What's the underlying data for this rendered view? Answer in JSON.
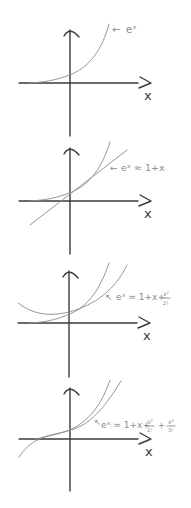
{
  "diagram": {
    "colors": {
      "axes": "#3a3a3a",
      "curves": "#8a8a8a",
      "background": "#ffffff"
    },
    "panels": [
      {
        "label_arrow": "←",
        "label": "eˣ",
        "axis_label": "x",
        "approximation": "none"
      },
      {
        "label_arrow": "←",
        "label": "eˣ ≈ 1+x",
        "axis_label": "x",
        "approximation": "1+x"
      },
      {
        "label_arrow": "↖",
        "label": "eˣ ≈ 1+x+",
        "frac_num": "x²",
        "frac_den": "2!",
        "axis_label": "x",
        "approximation": "1+x+x^2/2!"
      },
      {
        "label_arrow": "↖",
        "label": "eˣ ≈ 1+x+",
        "frac_num": "x²",
        "frac_den": "2!",
        "plus": "+",
        "frac2_num": "x³",
        "frac2_den": "3!",
        "axis_label": "x",
        "approximation": "1+x+x^2/2!+x^3/3!"
      }
    ]
  }
}
